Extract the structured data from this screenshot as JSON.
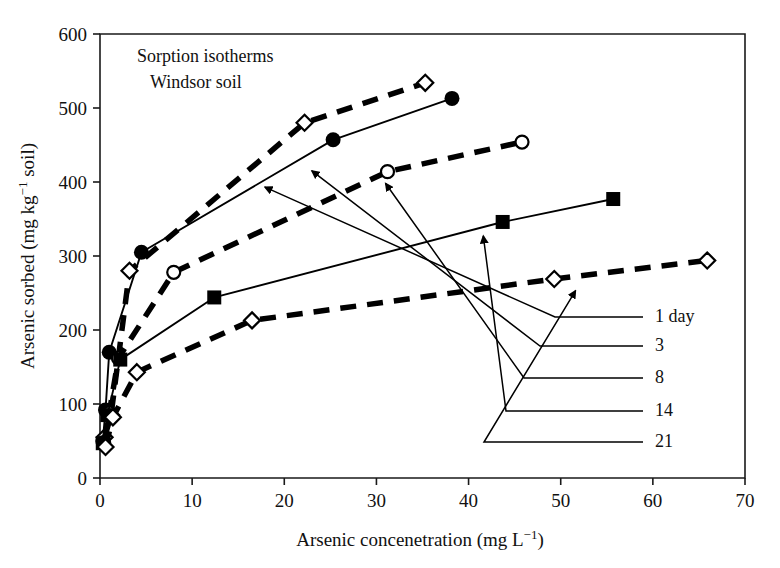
{
  "chart_data": {
    "type": "line",
    "title": "",
    "annotation_lines": [
      "Sorption isotherms",
      "Windsor soil"
    ],
    "xlabel": "Arsenic concenetration (mg L",
    "xlabel_sup": "−1",
    "xlabel_tail": ")",
    "ylabel": "Arsenic sorbed (mg kg",
    "ylabel_sup": "−1",
    "ylabel_tail": " soil)",
    "xlim": [
      0,
      70
    ],
    "ylim": [
      0,
      600
    ],
    "xticks": [
      "0",
      "10",
      "20",
      "30",
      "40",
      "50",
      "60",
      "70"
    ],
    "xtick_values": [
      0,
      10,
      20,
      30,
      40,
      50,
      60,
      70
    ],
    "yticks": [
      "0",
      "100",
      "200",
      "300",
      "400",
      "500",
      "600"
    ],
    "ytick_values": [
      0,
      100,
      200,
      300,
      400,
      500,
      600
    ],
    "grid": false,
    "legend_position": "right-inside",
    "series": [
      {
        "name": "1 day",
        "label": "1 day",
        "marker": "filled-circle",
        "linestyle": "solid",
        "x": [
          0.3,
          0.6,
          1.0,
          4.5,
          25.3,
          38.2
        ],
        "y": [
          50,
          92,
          170,
          305,
          457,
          513
        ]
      },
      {
        "name": "3",
        "label": "3",
        "marker": "open-diamond",
        "linestyle": "dashed",
        "x": [
          0.5,
          1.2,
          3.2,
          22.2,
          35.3
        ],
        "y": [
          55,
          85,
          280,
          480,
          534
        ]
      },
      {
        "name": "8",
        "label": "8",
        "marker": "open-circle",
        "linestyle": "dashed",
        "x": [
          0.4,
          1.0,
          2.0,
          8.0,
          31.2,
          45.8
        ],
        "y": [
          48,
          88,
          162,
          278,
          414,
          454
        ]
      },
      {
        "name": "14",
        "label": "14",
        "marker": "filled-square",
        "linestyle": "solid",
        "x": [
          0.3,
          0.8,
          2.2,
          12.4,
          43.7,
          55.7
        ],
        "y": [
          47,
          85,
          160,
          244,
          346,
          377
        ]
      },
      {
        "name": "21",
        "label": "21",
        "marker": "open-diamond",
        "linestyle": "dashed",
        "x": [
          0.6,
          1.4,
          4.0,
          16.5,
          49.3,
          65.9
        ],
        "y": [
          42,
          82,
          143,
          213,
          269,
          294
        ]
      }
    ],
    "legend_entries": [
      {
        "label": "1 day",
        "points_to_x": 17.9,
        "points_to_y": 393
      },
      {
        "label": "3",
        "points_to_x": 23.0,
        "points_to_y": 415
      },
      {
        "label": "8",
        "points_to_x": 31.0,
        "points_to_y": 398
      },
      {
        "label": "14",
        "points_to_x": 41.6,
        "points_to_y": 327
      },
      {
        "label": "21",
        "points_to_x": 51.6,
        "points_to_y": 253
      }
    ]
  },
  "colors": {
    "axis": "#1a1a1a",
    "line": "#000000",
    "marker_fill": "#000000",
    "marker_open": "#ffffff",
    "background": "#ffffff"
  }
}
